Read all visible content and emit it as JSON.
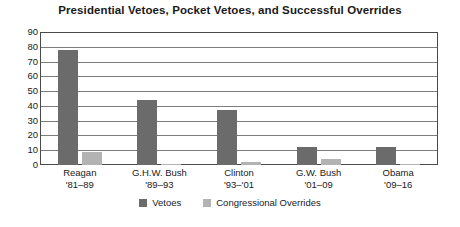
{
  "chart_data": {
    "type": "bar",
    "title": "Presidential Vetoes, Pocket Vetoes, and Successful Overrides",
    "xlabel": "",
    "ylabel": "",
    "ylim": [
      0,
      90
    ],
    "ytick_step": 10,
    "yticks": [
      90,
      80,
      70,
      60,
      50,
      40,
      30,
      20,
      10,
      0
    ],
    "grid": true,
    "legend_position": "bottom",
    "categories": [
      "Reagan '81–89",
      "G.H.W. Bush '89–93",
      "Clinton '93–'01",
      "G.W. Bush '01–09",
      "Obama '09–16"
    ],
    "category_lines": [
      {
        "line1": "Reagan",
        "line2": "'81–89"
      },
      {
        "line1": "G.H.W. Bush",
        "line2": "'89–93"
      },
      {
        "line1": "Clinton",
        "line2": "'93–'01"
      },
      {
        "line1": "G.W. Bush",
        "line2": "'01–09"
      },
      {
        "line1": "Obama",
        "line2": "'09–16"
      }
    ],
    "series": [
      {
        "name": "Vetoes",
        "color": "#6b6b6b",
        "values": [
          78,
          44,
          37,
          12,
          12
        ]
      },
      {
        "name": "Congressional Overrides",
        "color": "#b3b3b3",
        "values": [
          9,
          1,
          2,
          4,
          1
        ]
      }
    ]
  },
  "legend": {
    "items": [
      {
        "label": "Vetoes"
      },
      {
        "label": "Congressional Overrides"
      }
    ]
  }
}
